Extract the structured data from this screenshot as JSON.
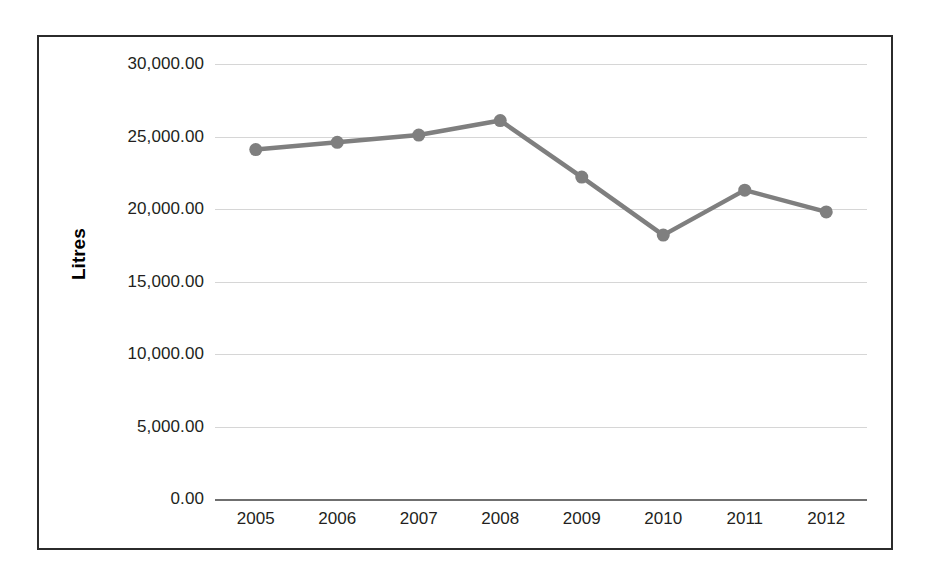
{
  "chart_data": {
    "type": "line",
    "title": "",
    "xlabel": "",
    "ylabel": "Litres",
    "categories": [
      "2005",
      "2006",
      "2007",
      "2008",
      "2009",
      "2010",
      "2011",
      "2012"
    ],
    "values": [
      24100,
      24600,
      25100,
      26100,
      22200,
      18200,
      21300,
      19800
    ],
    "series": [
      {
        "name": "Litres",
        "values": [
          24100,
          24600,
          25100,
          26100,
          22200,
          18200,
          21300,
          19800
        ]
      }
    ],
    "ylim": [
      0,
      30000
    ],
    "ytick_values": [
      0,
      5000,
      10000,
      15000,
      20000,
      25000,
      30000
    ],
    "ytick_labels": [
      "0.00",
      "5,000.00",
      "10,000.00",
      "15,000.00",
      "20,000.00",
      "25,000.00",
      "30,000.00"
    ],
    "grid": true,
    "legend": false,
    "legend_position": "none",
    "line_color": "#7f7f7f",
    "marker_color": "#7f7f7f",
    "gridline_color": "#d6d6d6",
    "axis_color": "#6f6f6f",
    "border_color": "#2b2b2b",
    "background_color": "#ffffff"
  }
}
